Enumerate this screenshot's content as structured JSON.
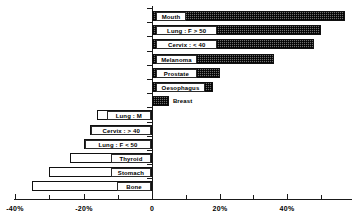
{
  "chart_data": {
    "type": "bar",
    "orientation": "horizontal",
    "title": "",
    "subtitle": "",
    "xlabel": "",
    "ylabel": "",
    "xlim": [
      -40,
      55
    ],
    "grid": false,
    "legend": null,
    "axis_zero_label": "0",
    "categories": [
      "Mouth",
      "Lung : F > 50",
      "Cervix : < 40",
      "Melanoma",
      "Prostate",
      "Oesophagus",
      "Breast",
      "Lung : M",
      "Cervix : > 40",
      "Lung : F < 50",
      "Thyroid",
      "Stomach",
      "Bone"
    ],
    "values": [
      57,
      50,
      48,
      36,
      20,
      18,
      5,
      -16,
      -18,
      -20,
      -24,
      -30,
      -35
    ],
    "xticks_major": [
      -40,
      -20,
      0,
      20,
      40
    ],
    "xtick_labels": [
      "-40%",
      "-20%",
      "0",
      "20%",
      "40%"
    ],
    "xticks_minor": [
      -30,
      -10,
      10,
      30,
      50
    ],
    "series_styles": {
      "positive": "hatched-dark",
      "negative": "white-outlined"
    }
  },
  "colors": {
    "axis": "#1a1a1a",
    "bar_positive_fill": "#6e6e6e",
    "bar_positive_stroke": "#111111",
    "bar_negative_fill": "#ffffff",
    "bar_negative_stroke": "#111111",
    "label_box_border": "#2a2a2a",
    "label_box_fill": "#ffffff",
    "text": "#000000",
    "background": "#ffffff"
  }
}
